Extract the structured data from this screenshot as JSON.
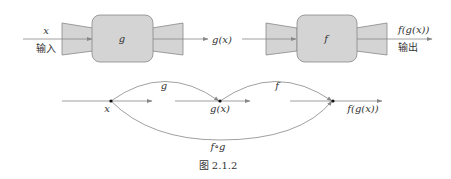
{
  "colors": {
    "box_fill": "#d4d4d4",
    "box_stroke": "#888888",
    "line": "#888888",
    "text": "#333333",
    "point": "#111111"
  },
  "top": {
    "g_block": {
      "label": "g",
      "input_label": "x",
      "input_caption": "输入",
      "output_label": "g(x)"
    },
    "f_block": {
      "label": "f",
      "output_label": "f(g(x))",
      "output_caption": "输出"
    }
  },
  "bottom": {
    "points": [
      "x",
      "g(x)",
      "f(g(x))"
    ],
    "arcs": {
      "g": "g",
      "f": "f",
      "composite": "f∘g"
    }
  },
  "caption": "图 2.1.2"
}
